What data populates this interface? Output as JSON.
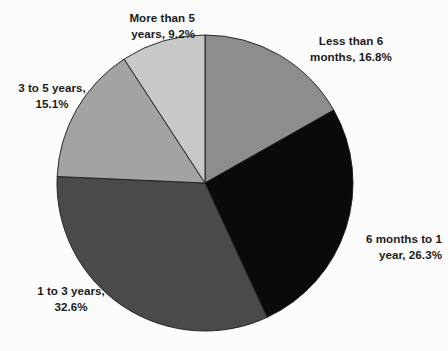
{
  "chart_data": {
    "type": "pie",
    "title": "",
    "subtitle": "",
    "xlabel": "",
    "ylabel": "",
    "legend_position": "none",
    "grid": false,
    "start_angle_deg": 0,
    "direction": "clockwise",
    "categories": [
      "Less than 6 months",
      "6 months to 1 year",
      "1 to 3 years",
      "3 to 5 years",
      "More than 5 years"
    ],
    "values": [
      16.8,
      26.3,
      32.6,
      15.1,
      9.2
    ],
    "value_unit": "%",
    "colors": [
      "#8d8d8d",
      "#0a0a0a",
      "#4a4a4a",
      "#a3a3a3",
      "#c8c8c8"
    ],
    "slices": [
      {
        "label": "Less than 6 months",
        "value": 16.8,
        "color": "#8d8d8d",
        "label_line1": "Less than 6",
        "label_line2": "months, 16.8%"
      },
      {
        "label": "6 months to 1 year",
        "value": 26.3,
        "color": "#0a0a0a",
        "label_line1": "6 months to 1",
        "label_line2": "year, 26.3%"
      },
      {
        "label": "1 to 3 years",
        "value": 32.6,
        "color": "#4a4a4a",
        "label_line1": "1 to 3 years,",
        "label_line2": "32.6%"
      },
      {
        "label": "3 to 5 years",
        "value": 15.1,
        "color": "#a3a3a3",
        "label_line1": "3 to 5 years,",
        "label_line2": "15.1%"
      },
      {
        "label": "More than 5 years",
        "value": 9.2,
        "color": "#c8c8c8",
        "label_line1": "More than 5",
        "label_line2": "years, 9.2%"
      }
    ],
    "geometry": {
      "center_x": 205,
      "center_y": 183,
      "radius": 148
    },
    "style": {
      "background": "#fcfcfc",
      "text_color": "#1a1a1a",
      "slice_border": "#1a1a1a"
    }
  }
}
